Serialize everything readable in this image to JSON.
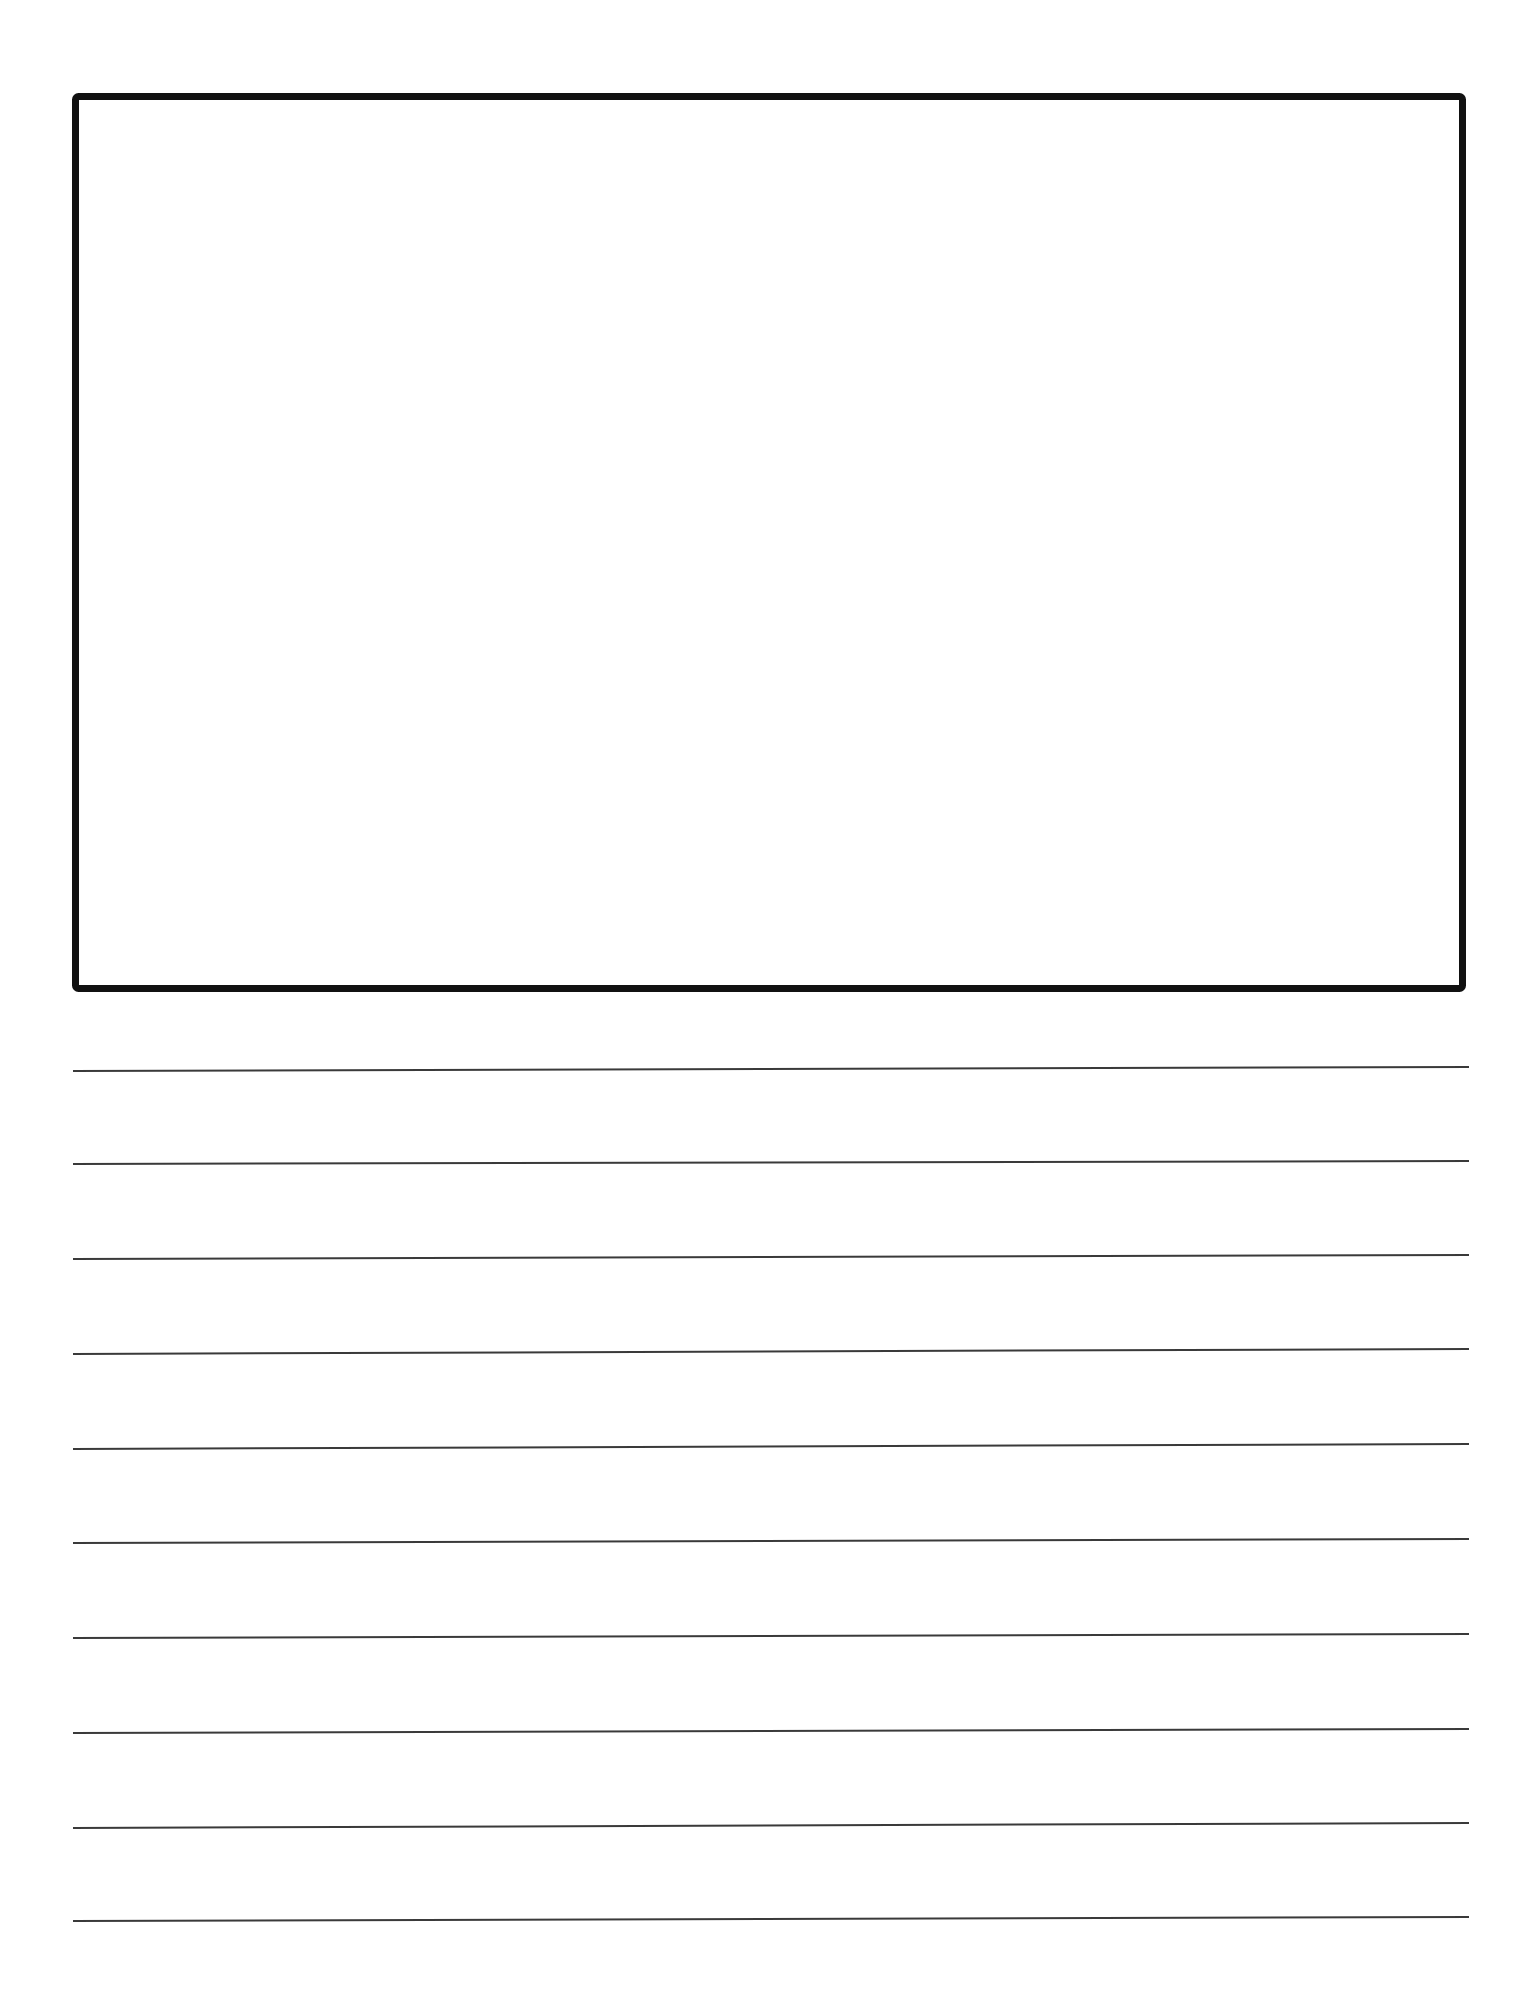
{
  "page": {
    "width": 1530,
    "height": 1991,
    "background": "#ffffff"
  },
  "drawing_box": {
    "x1": 72,
    "y1": 93,
    "x2": 1466,
    "y2": 992,
    "stroke": "#111111",
    "stroke_width": 7,
    "corner_radius": 3
  },
  "writing_lines": {
    "stroke": "#3a3a3a",
    "stroke_width": 2,
    "x_start": 73,
    "x_end": 1469,
    "lines": [
      {
        "y_left": 1071,
        "y_right": 1067
      },
      {
        "y_left": 1164,
        "y_right": 1161
      },
      {
        "y_left": 1259,
        "y_right": 1255
      },
      {
        "y_left": 1354,
        "y_right": 1349
      },
      {
        "y_left": 1449,
        "y_right": 1444
      },
      {
        "y_left": 1543,
        "y_right": 1539
      },
      {
        "y_left": 1638,
        "y_right": 1634
      },
      {
        "y_left": 1733,
        "y_right": 1729
      },
      {
        "y_left": 1828,
        "y_right": 1823
      },
      {
        "y_left": 1921,
        "y_right": 1917
      }
    ]
  }
}
